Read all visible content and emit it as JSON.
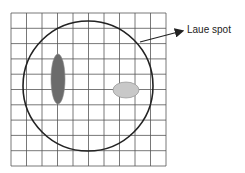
{
  "diagram": {
    "grid": {
      "left": 11,
      "top": 13,
      "right": 166,
      "bottom": 166,
      "columns": 10,
      "rows": 10,
      "color": "#555555"
    },
    "circle": {
      "cx": 88,
      "cy": 86,
      "r": 65,
      "stroke": "#222222"
    },
    "spots": [
      {
        "name": "elongated-spot",
        "cx": 58,
        "cy": 79,
        "rx": 7,
        "ry": 25,
        "fill": "#6b6b6b"
      },
      {
        "name": "oval-spot",
        "cx": 126,
        "cy": 90,
        "rx": 13,
        "ry": 8,
        "fill": "#c8c8c8"
      }
    ],
    "arrow": {
      "x1": 140,
      "y1": 42,
      "x2": 182,
      "y2": 31,
      "color": "#222222"
    },
    "label": {
      "text": "Laue spot",
      "x": 187,
      "y": 24
    }
  }
}
